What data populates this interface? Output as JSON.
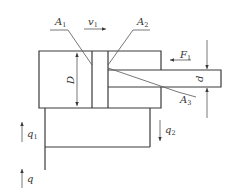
{
  "diagram": {
    "type": "hydraulic-cylinder-schematic",
    "labels": {
      "A1": {
        "main": "A",
        "sub": "1"
      },
      "A2": {
        "main": "A",
        "sub": "2"
      },
      "A3": {
        "main": "A",
        "sub": "3"
      },
      "v1": {
        "main": "v",
        "sub": "1"
      },
      "F1": {
        "main": "F",
        "sub": "1"
      },
      "D": {
        "main": "D"
      },
      "d": {
        "main": "d"
      },
      "q1": {
        "main": "q",
        "sub": "1"
      },
      "q2": {
        "main": "q",
        "sub": "2"
      },
      "q": {
        "main": "q"
      }
    },
    "colors": {
      "stroke": "#3a3a3a",
      "background": "#ffffff",
      "text": "#333333"
    }
  }
}
